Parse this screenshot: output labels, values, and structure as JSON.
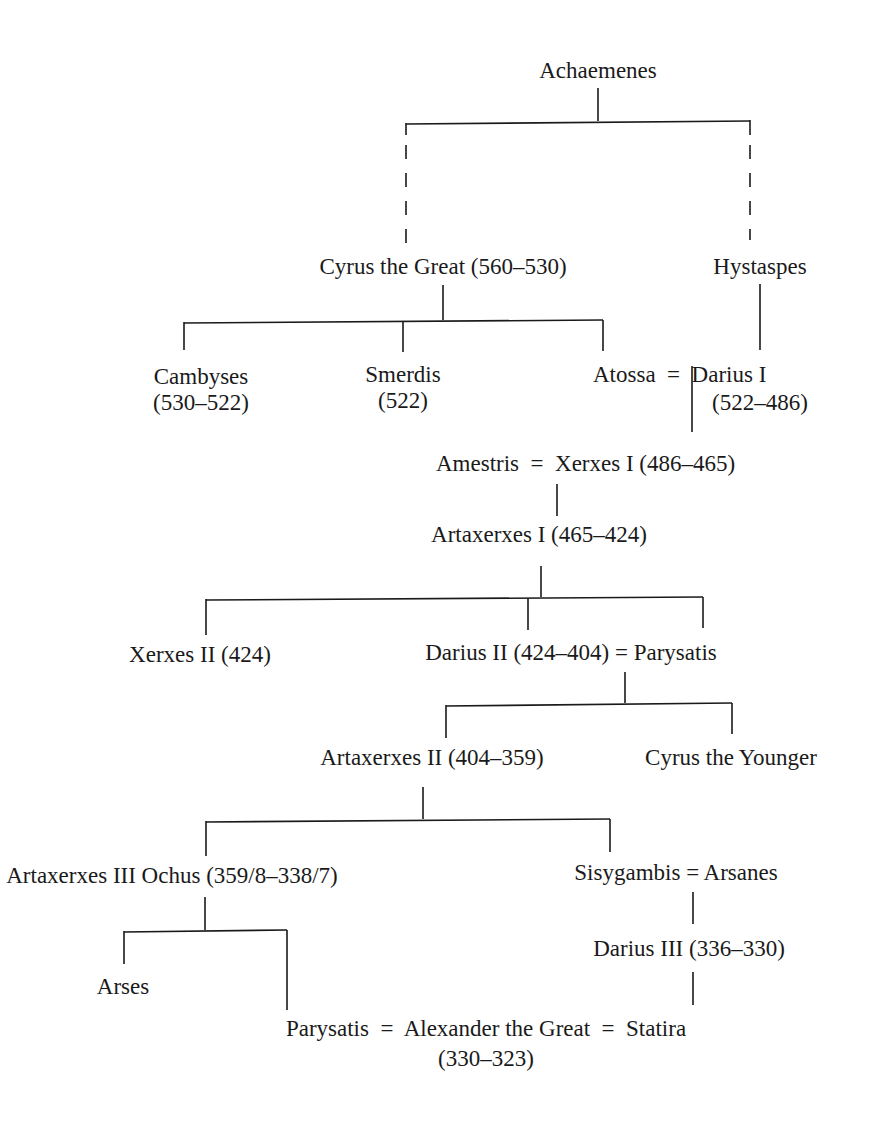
{
  "diagram": {
    "type": "family-tree",
    "nodes": {
      "achaemenes": "Achaemenes",
      "cyrus_great": "Cyrus the Great (560–530)",
      "hystaspes": "Hystaspes",
      "cambyses_name": "Cambyses",
      "cambyses_dates": "(530–522)",
      "smerdis_name": "Smerdis",
      "smerdis_dates": "(522)",
      "atossa_darius": "Atossa  =  Darius I",
      "darius1_dates": "(522–486)",
      "amestris_xerxes": "Amestris  =  Xerxes I (486–465)",
      "artaxerxes1": "Artaxerxes I (465–424)",
      "xerxes2": "Xerxes II (424)",
      "darius2_parysatis": "Darius II (424–404) = Parysatis",
      "artaxerxes2": "Artaxerxes II (404–359)",
      "cyrus_younger": "Cyrus the Younger",
      "artaxerxes3": "Artaxerxes III Ochus (359/8–338/7)",
      "sisygambis_arsanes": "Sisygambis = Arsanes",
      "darius3": "Darius III (336–330)",
      "arses": "Arses",
      "alexander_line": "Parysatis  =  Alexander the Great  =  Statira",
      "alexander_dates": "(330–323)"
    },
    "relations": [
      {
        "parent": "Achaemenes",
        "children": [
          "Cyrus the Great",
          "Hystaspes"
        ],
        "style": "dashed"
      },
      {
        "parent": "Cyrus the Great",
        "children": [
          "Cambyses",
          "Smerdis",
          "Atossa"
        ]
      },
      {
        "parent": "Hystaspes",
        "children": [
          "Darius I"
        ]
      },
      {
        "parent": "Atossa = Darius I",
        "children": [
          "Xerxes I"
        ]
      },
      {
        "parent": "Amestris = Xerxes I",
        "children": [
          "Artaxerxes I"
        ]
      },
      {
        "parent": "Artaxerxes I",
        "children": [
          "Xerxes II",
          "Darius II",
          "Parysatis"
        ]
      },
      {
        "parent": "Darius II = Parysatis",
        "children": [
          "Artaxerxes II",
          "Cyrus the Younger"
        ]
      },
      {
        "parent": "Artaxerxes II",
        "children": [
          "Artaxerxes III Ochus",
          "Sisygambis"
        ]
      },
      {
        "parent": "Artaxerxes III Ochus",
        "children": [
          "Arses",
          "Parysatis"
        ]
      },
      {
        "parent": "Sisygambis = Arsanes",
        "children": [
          "Darius III"
        ]
      },
      {
        "parent": "Darius III",
        "children": [
          "Statira"
        ]
      }
    ]
  }
}
